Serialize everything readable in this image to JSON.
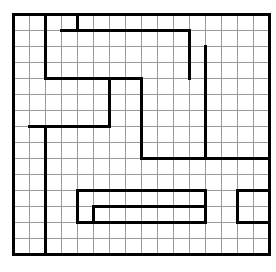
{
  "figure": {
    "title": "",
    "kind": "maze-grid-puzzle",
    "background_color": "#ffffff",
    "grid_line_color": "#9a9a9a",
    "wall_color": "#000000",
    "border_color": "#000000"
  },
  "grid": {
    "columns": 16,
    "rows": 15,
    "cell_size": 16,
    "origin_x": 13,
    "origin_y": 14,
    "grid_line_width": 1,
    "wall_line_width": 3,
    "border_line_width": 3
  },
  "border": {
    "x": 13,
    "y": 14,
    "width": 256,
    "height": 240
  },
  "walls": {
    "description": "Interior maze wall segments in grid-unit coordinates (col,row) from the top-left corner of the grid.",
    "horizontal": [
      {
        "row": 1,
        "col_start": 3,
        "col_end": 4
      },
      {
        "row": 1,
        "col_start": 4,
        "col_end": 11
      },
      {
        "row": 4,
        "col_start": 2,
        "col_end": 8
      },
      {
        "row": 7,
        "col_start": 1,
        "col_end": 6
      },
      {
        "row": 9,
        "col_start": 8,
        "col_end": 16
      },
      {
        "row": 11,
        "col_start": 4,
        "col_end": 12
      },
      {
        "row": 11,
        "col_start": 14,
        "col_end": 16
      },
      {
        "row": 12,
        "col_start": 5,
        "col_end": 12
      },
      {
        "row": 13,
        "col_start": 4,
        "col_end": 12
      },
      {
        "row": 13,
        "col_start": 14,
        "col_end": 16
      }
    ],
    "vertical": [
      {
        "col": 2,
        "row_start": 0,
        "row_end": 4
      },
      {
        "col": 4,
        "row_start": 0,
        "row_end": 1
      },
      {
        "col": 11,
        "row_start": 1,
        "row_end": 4
      },
      {
        "col": 8,
        "row_start": 4,
        "row_end": 9
      },
      {
        "col": 6,
        "row_start": 4,
        "row_end": 7
      },
      {
        "col": 12,
        "row_start": 2,
        "row_end": 9
      },
      {
        "col": 2,
        "row_start": 7,
        "row_end": 15
      },
      {
        "col": 4,
        "row_start": 11,
        "row_end": 13
      },
      {
        "col": 12,
        "row_start": 11,
        "row_end": 13
      },
      {
        "col": 5,
        "row_start": 12,
        "row_end": 13
      },
      {
        "col": 14,
        "row_start": 11,
        "row_end": 13
      }
    ]
  },
  "artifacts": {
    "description": "Faint cropped text descenders along the very top edge",
    "dots_x": [
      14,
      30,
      83,
      178
    ]
  }
}
